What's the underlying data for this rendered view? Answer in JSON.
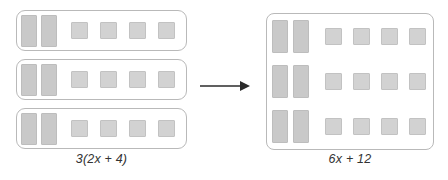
{
  "diagram": {
    "type": "algebra-tiles",
    "colors": {
      "background": "#ffffff",
      "container_border": "#b9b9b9",
      "x_tile_fill": "#c9c9c9",
      "x_tile_border": "#bdbdbd",
      "unit_tile_fill": "#d2d2d2",
      "unit_tile_border": "#c2c2c2",
      "text": "#333333",
      "arrow": "#2b2b2b"
    },
    "left": {
      "label": "3(2x + 4)",
      "label_parts": {
        "coefficient": "3",
        "open_paren": "(",
        "x_term": "2x",
        "operator": "+",
        "constant": "4",
        "close_paren": ")"
      },
      "group_count": 3,
      "rows": [
        {
          "x_tiles": 2,
          "unit_tiles": 4
        },
        {
          "x_tiles": 2,
          "unit_tiles": 4
        },
        {
          "x_tiles": 2,
          "unit_tiles": 4
        }
      ]
    },
    "arrow": {
      "icon": "arrow-right-icon",
      "direction": "right"
    },
    "right": {
      "label": "6x + 12",
      "label_parts": {
        "x_term": "6x",
        "operator": "+",
        "constant": "12"
      },
      "group_count": 1,
      "rows": [
        {
          "x_tiles": 2,
          "unit_tiles": 4
        },
        {
          "x_tiles": 2,
          "unit_tiles": 4
        },
        {
          "x_tiles": 2,
          "unit_tiles": 4
        }
      ],
      "total_x_tiles": 6,
      "total_unit_tiles": 12
    }
  }
}
